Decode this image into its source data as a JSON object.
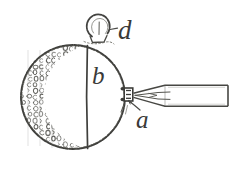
{
  "figure": {
    "kind": "line-engraving-diagram",
    "background_color": "#ffffff",
    "ink_color": "#3a3a38",
    "caption": "",
    "labels": [
      {
        "id": "d",
        "text": "d",
        "target": "top-ring-knob",
        "x": 118,
        "y": 17
      },
      {
        "id": "b",
        "text": "b",
        "target": "plain-hemisphere",
        "x": 92,
        "y": 63
      },
      {
        "id": "a",
        "text": "a",
        "target": "attachment-block",
        "x": 136,
        "y": 107
      }
    ],
    "parts": {
      "sphere": {
        "name": "sphere-body",
        "center_x": 73,
        "center_y": 97,
        "radius": 52,
        "divider_x": 87
      },
      "textured_half": {
        "name": "stippled-left-hemisphere",
        "pattern": "grid of small open circles",
        "cell_size": 6,
        "columns": 11,
        "rows": 17
      },
      "plain_half": {
        "name": "plain-right-hemisphere",
        "fill": "none"
      },
      "knob": {
        "name": "top-ring-knob",
        "center_x": 99,
        "center_y": 27,
        "radius": 11
      },
      "attachment_block": {
        "name": "attachment-block",
        "x": 124,
        "y": 88,
        "width": 9,
        "height": 13
      },
      "rod": {
        "name": "tapered-rod",
        "tip_x": 133,
        "tip_y": 95,
        "body_left_x": 162,
        "body_right_x": 228,
        "body_top_y": 85,
        "body_bottom_y": 106
      }
    }
  }
}
